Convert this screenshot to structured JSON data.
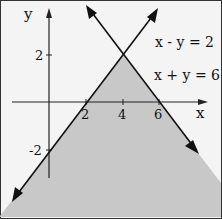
{
  "figure": {
    "axes": {
      "x_label": "x",
      "y_label": "y"
    },
    "x_ticks": [
      {
        "value": 2,
        "label": "2"
      },
      {
        "value": 4,
        "label": "4"
      },
      {
        "value": 6,
        "label": "6"
      }
    ],
    "y_ticks": [
      {
        "value": 2,
        "label": "2"
      },
      {
        "value": -2,
        "label": "-2"
      }
    ],
    "equations": [
      {
        "label": "x - y = 2"
      },
      {
        "label": "x + y = 6"
      }
    ],
    "intersection": {
      "x": 4,
      "y": 2
    },
    "shaded_region": "below both lines (y ≤ x - 2 and y ≤ 6 - x)",
    "colors": {
      "shade": "#c8c8c8",
      "line": "#111111",
      "background": "#f4f4f4"
    }
  }
}
